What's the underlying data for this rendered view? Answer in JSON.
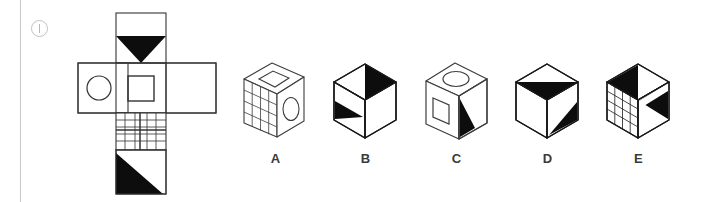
{
  "puzzle": {
    "type": "cube-net-folding",
    "marker": {
      "icon": "circled-i-icon",
      "label": "i"
    },
    "net": {
      "name": "cube-unfolded-net",
      "description": "Cross-shaped net of six square faces",
      "faces": [
        {
          "id": "top",
          "position": "column-center-row-1",
          "pattern": "black-downward-triangle"
        },
        {
          "id": "left",
          "position": "column-left-row-2",
          "pattern": "circle-outline"
        },
        {
          "id": "center",
          "position": "column-center-row-2",
          "pattern": "square-outline"
        },
        {
          "id": "right",
          "position": "column-right-row-2",
          "pattern": "blank"
        },
        {
          "id": "grid",
          "position": "column-center-row-3",
          "pattern": "grid-lines"
        },
        {
          "id": "bottom",
          "position": "column-center-row-4",
          "pattern": "black-lower-left-triangle"
        }
      ]
    },
    "options": [
      {
        "label": "A",
        "name": "option-a",
        "style": "boxy",
        "faces": {
          "top": "square-outline",
          "left": "grid-lines",
          "right": "ellipse-outline"
        }
      },
      {
        "label": "B",
        "name": "option-b",
        "style": "hex",
        "faces": {
          "top": "black-triangle-right",
          "left": "black-triangle-top",
          "right": "blank"
        }
      },
      {
        "label": "C",
        "name": "option-c",
        "style": "boxy",
        "faces": {
          "top": "ellipse-outline",
          "left": "square-outline",
          "right": "black-triangle-left"
        }
      },
      {
        "label": "D",
        "name": "option-d",
        "style": "hex",
        "faces": {
          "top": "black-downward-triangle",
          "left": "blank",
          "right": "black-triangle-upper"
        }
      },
      {
        "label": "E",
        "name": "option-e",
        "style": "hex",
        "faces": {
          "top": "black-triangle-left",
          "left": "grid-lines",
          "right": "black-triangle-left"
        }
      }
    ],
    "colors": {
      "ink": "#1a1a1a",
      "fill": "#0d0d0d",
      "rule": "#c9c9c9",
      "label": "#3a3a3a",
      "background": "#ffffff"
    }
  }
}
